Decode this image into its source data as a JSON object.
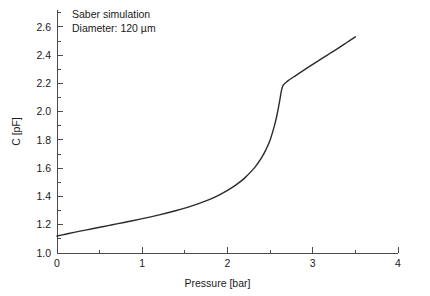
{
  "chart_data": {
    "type": "line",
    "title": "",
    "xlabel": "Pressure [bar]",
    "ylabel": "C [pF]",
    "xlim": [
      0,
      4
    ],
    "ylim": [
      1.0,
      2.72
    ],
    "grid": false,
    "legend": null,
    "x_major_ticks": [
      0,
      1,
      2,
      3,
      4
    ],
    "x_major_tick_labels": [
      "0",
      "1",
      "2",
      "3",
      "4"
    ],
    "x_minor_ticks": [
      0.5,
      1.5,
      2.5,
      3.5
    ],
    "y_major_ticks": [
      1.0,
      1.2,
      1.4,
      1.6,
      1.8,
      2.0,
      2.2,
      2.4,
      2.6
    ],
    "y_major_tick_labels": [
      "1.0",
      "1.2",
      "1.4",
      "1.6",
      "1.8",
      "2.0",
      "2.2",
      "2.4",
      "2.6"
    ],
    "y_minor_ticks": [
      1.1,
      1.3,
      1.5,
      1.7,
      1.9,
      2.1,
      2.3,
      2.5,
      2.7
    ],
    "annotations": [
      "Saber simulation",
      "Diameter: 120 µm"
    ],
    "series": [
      {
        "name": "Saber simulation",
        "color": "#2b2b2b",
        "x": [
          0.0,
          0.1,
          0.2,
          0.3,
          0.4,
          0.5,
          0.6,
          0.7,
          0.8,
          0.9,
          1.0,
          1.1,
          1.2,
          1.3,
          1.4,
          1.5,
          1.6,
          1.7,
          1.8,
          1.9,
          2.0,
          2.1,
          2.2,
          2.3,
          2.35,
          2.4,
          2.45,
          2.5,
          2.55,
          2.58,
          2.61,
          2.63,
          2.65,
          2.7,
          2.8,
          2.9,
          3.0,
          3.1,
          3.2,
          3.3,
          3.4,
          3.5
        ],
        "y": [
          1.12,
          1.133,
          1.146,
          1.158,
          1.17,
          1.182,
          1.194,
          1.206,
          1.218,
          1.23,
          1.243,
          1.256,
          1.27,
          1.285,
          1.301,
          1.318,
          1.337,
          1.358,
          1.382,
          1.41,
          1.443,
          1.482,
          1.53,
          1.592,
          1.63,
          1.675,
          1.73,
          1.8,
          1.9,
          1.975,
          2.07,
          2.14,
          2.185,
          2.215,
          2.256,
          2.296,
          2.335,
          2.374,
          2.412,
          2.45,
          2.49,
          2.53
        ]
      }
    ]
  },
  "axes_geometry": {
    "x0_px": 57,
    "x1_px": 398,
    "y_bottom_px": 253,
    "y_top_px": 10
  }
}
